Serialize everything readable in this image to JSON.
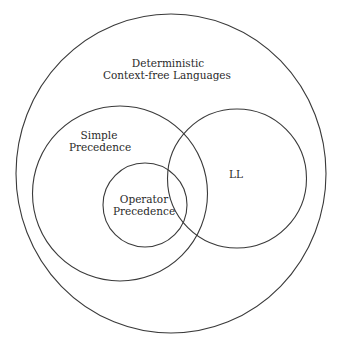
{
  "diagram": {
    "type": "venn",
    "sets": [
      {
        "id": "dcfl",
        "label_lines": [
          "Deterministic",
          "Context-free Languages"
        ],
        "shape": {
          "cx": 171,
          "cy": 173.5,
          "rx": 155,
          "ry": 159.5
        },
        "contains": [
          "simple_precedence",
          "ll"
        ]
      },
      {
        "id": "simple_precedence",
        "label_lines": [
          "Simple",
          "Precedence"
        ],
        "shape": {
          "cx": 120,
          "cy": 193.5,
          "r": 87.5
        },
        "contains": [
          "operator_precedence"
        ],
        "overlaps": [
          "ll"
        ]
      },
      {
        "id": "ll",
        "label_lines": [
          "LL"
        ],
        "shape": {
          "cx": 237,
          "cy": 178.5,
          "r": 69.5
        },
        "overlaps": [
          "simple_precedence",
          "operator_precedence"
        ]
      },
      {
        "id": "operator_precedence",
        "label_lines": [
          "Operator",
          "Precedence"
        ],
        "shape": {
          "cx": 145,
          "cy": 205,
          "r": 42
        },
        "overlaps": [
          "ll"
        ]
      }
    ],
    "colors": {
      "stroke": "#3a3a3a",
      "text": "#2a2a2a",
      "background": "#ffffff"
    }
  }
}
